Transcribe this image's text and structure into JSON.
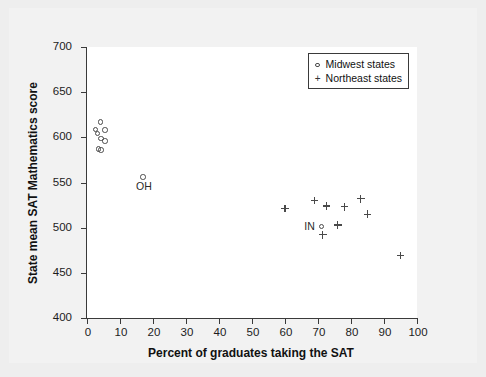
{
  "chart_data": {
    "type": "scatter",
    "title": "",
    "xlabel": "Percent of graduates taking the SAT",
    "ylabel": "State mean SAT Mathematics score",
    "xlim": [
      0,
      100
    ],
    "ylim": [
      400,
      700
    ],
    "xticks": [
      0,
      10,
      20,
      30,
      40,
      50,
      60,
      70,
      80,
      90,
      100
    ],
    "yticks": [
      400,
      450,
      500,
      550,
      600,
      650,
      700
    ],
    "grid": false,
    "legend_position": "top-right",
    "legend": [
      {
        "marker": "circle",
        "label": "Midwest states"
      },
      {
        "marker": "plus",
        "label": "Northeast states"
      }
    ],
    "series": [
      {
        "name": "Midwest states",
        "marker": "circle",
        "points": [
          {
            "x": 4.0,
            "y": 617
          },
          {
            "x": 2.5,
            "y": 609
          },
          {
            "x": 5.5,
            "y": 608
          },
          {
            "x": 3.2,
            "y": 604
          },
          {
            "x": 4.2,
            "y": 599
          },
          {
            "x": 5.4,
            "y": 596
          },
          {
            "x": 3.5,
            "y": 587
          },
          {
            "x": 4.2,
            "y": 586
          },
          {
            "x": 17.0,
            "y": 556,
            "label": "OH"
          },
          {
            "x": 71.0,
            "y": 501,
            "label": "IN"
          }
        ]
      },
      {
        "name": "Northeast states",
        "marker": "plus",
        "points": [
          {
            "x": 60.0,
            "y": 521
          },
          {
            "x": 69.0,
            "y": 530
          },
          {
            "x": 72.5,
            "y": 524
          },
          {
            "x": 78.0,
            "y": 523
          },
          {
            "x": 83.0,
            "y": 532
          },
          {
            "x": 85.0,
            "y": 515
          },
          {
            "x": 76.0,
            "y": 503
          },
          {
            "x": 71.5,
            "y": 492
          },
          {
            "x": 95.0,
            "y": 469
          }
        ]
      }
    ],
    "annotations": [
      {
        "text": "OH",
        "x": 17.0,
        "y": 556
      },
      {
        "text": "IN",
        "x": 71.0,
        "y": 501
      }
    ]
  }
}
